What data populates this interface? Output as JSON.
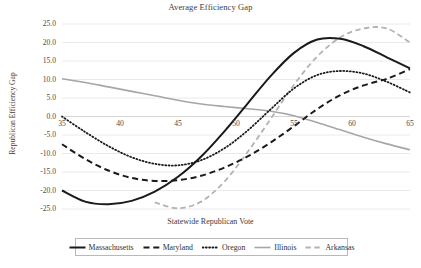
{
  "chart_data": {
    "type": "line",
    "title": "Average Efficiency Gap",
    "xlabel": "Statewide Republican Vote",
    "ylabel": "Republican Efficiency Gap",
    "xlim": [
      35,
      65
    ],
    "ylim": [
      -25,
      25
    ],
    "xticks": [
      "35",
      "40",
      "45",
      "50",
      "55",
      "60",
      "65"
    ],
    "yticks": [
      "25.0",
      "20.0",
      "15.0",
      "10.0",
      "5.0",
      "0.0",
      "-5.0",
      "-10.0",
      "-15.0",
      "-20.0",
      "-25.0"
    ],
    "grid": true,
    "legend_position": "bottom",
    "x": [
      35,
      37,
      39,
      41,
      43,
      45,
      47,
      49,
      51,
      53,
      55,
      57,
      59,
      61,
      63,
      65
    ],
    "series": [
      {
        "name": "Massachusetts",
        "style": "solid",
        "color": "#1a1a1a",
        "width": 2.0,
        "values": [
          -20.0,
          -23.0,
          -23.7,
          -22.8,
          -20.3,
          -16.3,
          -10.8,
          -4.0,
          3.5,
          11.0,
          17.2,
          20.8,
          21.0,
          19.0,
          16.0,
          13.0
        ]
      },
      {
        "name": "Maryland",
        "style": "dashed",
        "color": "#1a1a1a",
        "width": 2.0,
        "values": [
          -7.5,
          -11.5,
          -14.6,
          -16.6,
          -17.4,
          -17.2,
          -16.0,
          -13.8,
          -10.8,
          -7.0,
          -2.6,
          2.0,
          5.8,
          8.4,
          10.2,
          12.8
        ]
      },
      {
        "name": "Oregon",
        "style": "dotted",
        "color": "#1a1a1a",
        "width": 1.8,
        "values": [
          0.0,
          -4.2,
          -8.0,
          -11.0,
          -12.8,
          -13.2,
          -11.8,
          -8.6,
          -3.8,
          2.0,
          7.6,
          11.2,
          12.3,
          11.6,
          9.4,
          6.5
        ]
      },
      {
        "name": "Illinois",
        "style": "solid",
        "color": "#a6a6a6",
        "width": 1.6,
        "values": [
          10.2,
          9.2,
          8.0,
          6.8,
          5.6,
          4.4,
          3.4,
          2.7,
          2.1,
          1.4,
          0.2,
          -1.6,
          -3.6,
          -5.6,
          -7.4,
          -9.0
        ]
      },
      {
        "name": "Arkansas",
        "style": "dashed",
        "color": "#b3b3b3",
        "width": 1.8,
        "values": [
          null,
          null,
          null,
          null,
          -23.2,
          -24.8,
          -23.0,
          -17.6,
          -9.6,
          -0.6,
          8.6,
          16.2,
          21.4,
          23.8,
          23.8,
          20.0
        ]
      }
    ]
  },
  "legend": {
    "items": [
      {
        "label": "Massachusetts"
      },
      {
        "label": "Maryland"
      },
      {
        "label": "Oregon"
      },
      {
        "label": "Illinois"
      },
      {
        "label": "Arkansas"
      }
    ]
  }
}
